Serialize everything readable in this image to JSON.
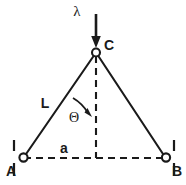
{
  "figure": {
    "type": "engineering-diagram",
    "background_color": "#ffffff",
    "line_color": "#1a1a1a",
    "width": 186,
    "height": 185
  },
  "labels": {
    "apex": "C",
    "support_left": "A",
    "support_right": "B",
    "member_length": "L",
    "half_span": "a",
    "angle": "Θ",
    "load": "λ"
  },
  "geometry": {
    "apex": {
      "x": 96,
      "y": 52
    },
    "support_left": {
      "x": 23,
      "y": 158
    },
    "support_right": {
      "x": 166,
      "y": 158
    },
    "baseline_y": 158,
    "centerline_x": 96,
    "load_arrow": {
      "x": 96,
      "y_start": 14,
      "y_end": 47
    },
    "angle_arc_radius": 40
  },
  "label_positions": {
    "apex": {
      "x": 104,
      "y": 48
    },
    "support_left": {
      "x": 7,
      "y": 172
    },
    "support_right": {
      "x": 172,
      "y": 172
    },
    "member_length": {
      "x": 45,
      "y": 106
    },
    "half_span": {
      "x": 63,
      "y": 152
    },
    "angle": {
      "x": 73,
      "y": 120
    },
    "load": {
      "x": 77,
      "y": 15
    }
  },
  "elements": {
    "left_member_name": "member-L-left",
    "right_member_name": "member-right",
    "centerline_name": "centerline-dashed",
    "baseline_name": "baseline-dashed",
    "apex_joint_name": "apex-pin-joint",
    "support_left_name": "support-pin-A",
    "support_right_name": "support-pin-B"
  }
}
